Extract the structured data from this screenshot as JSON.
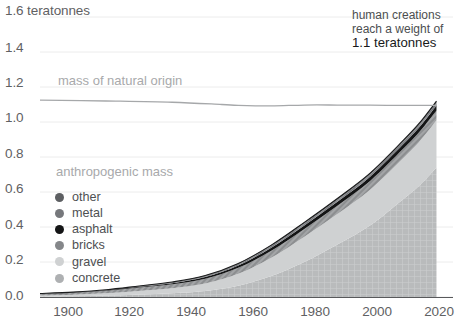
{
  "chart_data": {
    "type": "area",
    "title": "",
    "xlabel": "",
    "ylabel": "teratonnes",
    "xlim": [
      1900,
      2025
    ],
    "ylim": [
      0.0,
      1.6
    ],
    "grid": true,
    "legend_position": "inside-left",
    "x_ticks": [
      "1900",
      "1920",
      "1940",
      "1960",
      "1980",
      "2000",
      "2020"
    ],
    "x_tick_values": [
      1900,
      1920,
      1940,
      1960,
      1980,
      2000,
      2020
    ],
    "y_ticks": [
      "0.0",
      "0.2",
      "0.4",
      "0.6",
      "0.8",
      "1.0",
      "1.2",
      "1.4",
      "1.6 teratonnes"
    ],
    "y_tick_values": [
      0.0,
      0.2,
      0.4,
      0.6,
      0.8,
      1.0,
      1.2,
      1.4,
      1.6
    ],
    "x": [
      1900,
      1910,
      1920,
      1930,
      1940,
      1950,
      1960,
      1970,
      1980,
      1990,
      2000,
      2010,
      2015,
      2020
    ],
    "stack_order_bottom_to_top": [
      "concrete",
      "gravel",
      "bricks",
      "asphalt",
      "metal",
      "other"
    ],
    "series": [
      {
        "name": "concrete",
        "color": "#b9bbbc",
        "texture": "grid",
        "values": [
          0.002,
          0.004,
          0.008,
          0.015,
          0.022,
          0.035,
          0.065,
          0.12,
          0.2,
          0.3,
          0.41,
          0.56,
          0.64,
          0.74
        ]
      },
      {
        "name": "gravel",
        "color": "#cfd1d2",
        "texture": "none",
        "values": [
          0.006,
          0.009,
          0.013,
          0.02,
          0.028,
          0.042,
          0.068,
          0.105,
          0.145,
          0.175,
          0.205,
          0.235,
          0.252,
          0.27
        ]
      },
      {
        "name": "bricks",
        "color": "#8c8e90",
        "texture": "hatch",
        "values": [
          0.01,
          0.012,
          0.015,
          0.019,
          0.023,
          0.028,
          0.034,
          0.04,
          0.044,
          0.047,
          0.05,
          0.053,
          0.055,
          0.056
        ]
      },
      {
        "name": "asphalt",
        "color": "#141516",
        "texture": "none",
        "values": [
          0.0005,
          0.001,
          0.002,
          0.004,
          0.006,
          0.009,
          0.013,
          0.017,
          0.02,
          0.022,
          0.024,
          0.026,
          0.027,
          0.028
        ]
      },
      {
        "name": "metal",
        "color": "#74767a",
        "texture": "hatch",
        "values": [
          0.0008,
          0.0012,
          0.002,
          0.003,
          0.004,
          0.005,
          0.007,
          0.009,
          0.011,
          0.012,
          0.013,
          0.014,
          0.015,
          0.016
        ]
      },
      {
        "name": "other",
        "color": "#5d5f62",
        "texture": "none",
        "values": [
          0.0006,
          0.0009,
          0.0013,
          0.002,
          0.0026,
          0.0034,
          0.0045,
          0.0055,
          0.0065,
          0.007,
          0.0075,
          0.008,
          0.0085,
          0.009
        ]
      }
    ],
    "line_series": [
      {
        "name": "mass of natural origin",
        "color": "#a6a8aa",
        "x": [
          1900,
          1920,
          1940,
          1955,
          1960,
          1970,
          1980,
          1990,
          2000,
          2010,
          2020
        ],
        "values": [
          1.125,
          1.12,
          1.113,
          1.1,
          1.095,
          1.092,
          1.097,
          1.097,
          1.096,
          1.095,
          1.095
        ]
      }
    ],
    "annotations": [
      {
        "name": "crossover-note",
        "line1": "human creations",
        "line2": "reach a weight of",
        "line3": "1.1 teratonnes"
      }
    ]
  },
  "axes": {
    "y_axis_top_label": "1.6 teratonnes",
    "y_labels": [
      "1.4",
      "1.2",
      "1.0",
      "0.8",
      "0.6",
      "0.4",
      "0.2",
      "0.0"
    ],
    "x_labels": [
      "1900",
      "1920",
      "1940",
      "1960",
      "1980",
      "2000",
      "2020"
    ]
  },
  "labels": {
    "natural_origin": "mass of natural origin",
    "anthropogenic_mass": "anthropogenic mass"
  },
  "annotation": {
    "line1": "human creations",
    "line2": "reach a weight of",
    "line3": "1.1 teratonnes"
  },
  "legend": {
    "title": "anthropogenic mass",
    "items": [
      {
        "label": "other",
        "color": "#5d5f62"
      },
      {
        "label": "metal",
        "color": "#76787c"
      },
      {
        "label": "asphalt",
        "color": "#141516"
      },
      {
        "label": "bricks",
        "color": "#85878a"
      },
      {
        "label": "gravel",
        "color": "#cfd1d2"
      },
      {
        "label": "concrete",
        "color": "#aeb0b2"
      }
    ]
  },
  "colors": {
    "gridline": "#ececec",
    "axis": "#58595b",
    "tick_text": "#5f6163",
    "muted_text": "#a8a9ab",
    "background": "#ffffff"
  }
}
